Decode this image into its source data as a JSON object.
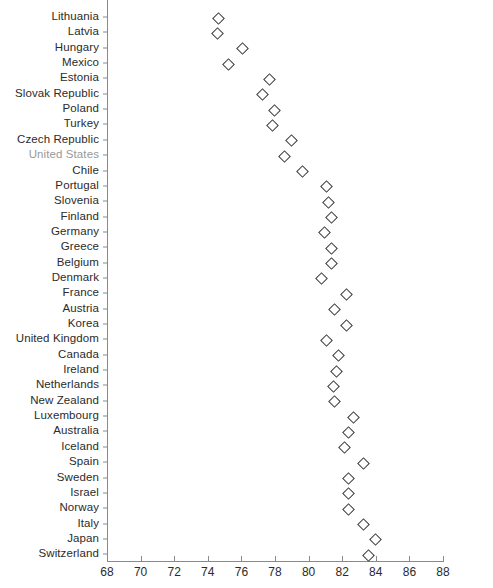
{
  "chart_data": {
    "type": "scatter",
    "title": "",
    "xlabel": "",
    "ylabel": "",
    "xlim": [
      68,
      88
    ],
    "xticks": [
      68,
      70,
      72,
      74,
      76,
      78,
      80,
      82,
      84,
      86,
      88
    ],
    "grid": false,
    "legend": null,
    "marker": "open-diamond",
    "orientation": "horizontal",
    "categories": [
      "Lithuania",
      "Latvia",
      "Hungary",
      "Mexico",
      "Estonia",
      "Slovak Republic",
      "Poland",
      "Turkey",
      "Czech Republic",
      "United States",
      "Chile",
      "Portugal",
      "Slovenia",
      "Finland",
      "Germany",
      "Greece",
      "Belgium",
      "Denmark",
      "France",
      "Austria",
      "Korea",
      "United Kingdom",
      "Canada",
      "Ireland",
      "Netherlands",
      "New Zealand",
      "Luxembourg",
      "Australia",
      "Iceland",
      "Spain",
      "Sweden",
      "Israel",
      "Norway",
      "Italy",
      "Japan",
      "Switzerland"
    ],
    "values": [
      74.6,
      74.5,
      76.0,
      75.2,
      77.6,
      77.2,
      77.9,
      77.8,
      78.9,
      78.5,
      79.6,
      81.0,
      81.1,
      81.3,
      80.9,
      81.3,
      81.3,
      80.7,
      82.2,
      81.5,
      82.2,
      81.0,
      81.7,
      81.6,
      81.4,
      81.5,
      82.6,
      82.3,
      82.1,
      83.2,
      82.3,
      82.3,
      82.3,
      83.2,
      83.9,
      83.5
    ],
    "highlighted_category": "United States",
    "highlight_color": "#9a9a9a",
    "marker_color": "#3a3a3a",
    "axis_color": "#8a8a8a",
    "text_color": "#2b2b2b"
  }
}
